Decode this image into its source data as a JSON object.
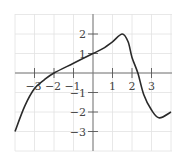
{
  "chart_data": {
    "type": "line",
    "title": "",
    "xlabel": "",
    "ylabel": "",
    "xlim": [
      -4,
      4
    ],
    "ylim": [
      -4,
      3
    ],
    "grid": true,
    "x_ticks": [
      "-3",
      "-2",
      "-1",
      "1",
      "2",
      "3"
    ],
    "y_ticks": [
      "2",
      "1",
      "-1",
      "-2",
      "-3"
    ],
    "series": [
      {
        "name": "f(x)",
        "x": [
          -4,
          -3.5,
          -3,
          -2.5,
          -2,
          -1,
          0,
          0.5,
          1,
          1.5,
          1.8,
          2,
          2.3,
          2.6,
          3,
          3.4,
          4
        ],
        "y": [
          -3,
          -1.7,
          -0.8,
          -0.35,
          0,
          0.5,
          1,
          1.25,
          1.6,
          2,
          1.6,
          0.8,
          0,
          -1.1,
          -1.9,
          -2.3,
          -2
        ]
      }
    ]
  }
}
